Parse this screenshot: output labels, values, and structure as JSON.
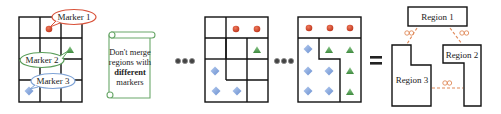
{
  "diagram": {
    "markers": [
      {
        "label": "Marker 1",
        "shape": "circle",
        "color": "#d9533b"
      },
      {
        "label": "Marker 2",
        "shape": "triangle",
        "color": "#5a9e5a"
      },
      {
        "label": "Marker 3",
        "shape": "diamond",
        "color": "#7fa3d6"
      }
    ],
    "callout_borders": {
      "marker1": "#d9533b",
      "marker2": "#5a9e5a",
      "marker3": "#7fa3d6"
    },
    "rule_scroll": {
      "lines": [
        "Don't merge",
        "regions with",
        "different",
        "markers"
      ],
      "bold_word": "different",
      "border_color": "#6aa86a"
    },
    "ellipsis_1": "●●●",
    "ellipsis_2": "●●●",
    "equals": "=",
    "regions": [
      {
        "label": "Region 1"
      },
      {
        "label": "Region 2"
      },
      {
        "label": "Region 3"
      }
    ],
    "links": [
      {
        "from": "Region 1",
        "to": "Region 3",
        "symbol": "∞"
      },
      {
        "from": "Region 1",
        "to": "Region 2",
        "symbol": "∞"
      },
      {
        "from": "Region 3",
        "to": "Region 2",
        "symbol": "∞"
      }
    ],
    "link_color": "#e08a5a"
  }
}
